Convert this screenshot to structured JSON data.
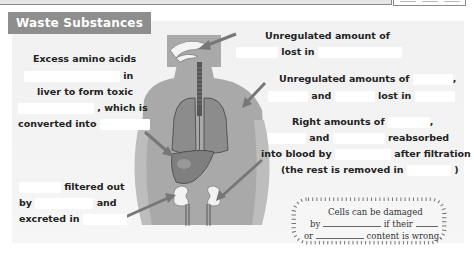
{
  "header": {
    "title": "Waste Substances"
  },
  "labels": {
    "amino": {
      "line1": "Excess amino acids",
      "line2_suffix": "in",
      "line3": "liver to form toxic",
      "line4_suffix": ", which is",
      "line5": "converted into"
    },
    "lungs": {
      "line1": "Unregulated amount of",
      "line2_mid": "lost in"
    },
    "skin": {
      "line1": "Unregulated amounts of",
      "line1_suffix": ",",
      "line2_and": "and",
      "line2_suffix": "lost in"
    },
    "kidney_right": {
      "line1": "Right amounts of",
      "line1_suffix": ",",
      "line2_and": "and",
      "line2_suffix": "reabsorbed",
      "line3_prefix": "into blood by",
      "line3_suffix": "after filtration",
      "line4_prefix": "(the rest is removed in",
      "line4_suffix": ")"
    },
    "kidney_left": {
      "line1_suffix": "filtered out",
      "line2_prefix": "by",
      "line2_suffix": "and",
      "line3_prefix": "excreted in"
    }
  },
  "note": {
    "line1": "Cells can be damaged",
    "line2_prefix": "by",
    "line2_mid": "if their",
    "line3_prefix": "or",
    "line3_suffix": "content is wrong."
  },
  "colors": {
    "title_bg": "#8e8e8e",
    "body_silhouette": "#a9a9a9",
    "organ": "#8c8c8c",
    "arrow": "#7a7a7a",
    "blank": "#ffffff"
  }
}
